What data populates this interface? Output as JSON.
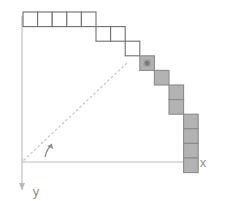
{
  "figure": {
    "title": "",
    "background": "#ffffff",
    "origin": {
      "x": 22,
      "y": 162
    },
    "cell_size": 14.6,
    "colors": {
      "axis": "#b9b9b9",
      "cell_stroke_open": "#6f6f6f",
      "cell_stroke_filled": "#8a8a8a",
      "cell_fill_open": "#ffffff",
      "cell_fill_filled": "#b3b3b3",
      "dashed_radius": "#c4c4c4",
      "angle_arc": "#8e8e8e",
      "label": "#8e8e8e",
      "marker_dot": "#7a7a7a"
    }
  },
  "axes": {
    "x": {
      "label": "x",
      "direction": "right",
      "arrow": true
    },
    "y": {
      "label": "y",
      "direction": "down",
      "arrow": true
    }
  },
  "annotations": {
    "angle_arc": {
      "name": "theta-arc",
      "visible": true
    },
    "radius_line": {
      "name": "dashed-radius",
      "style": "dotted",
      "from": "origin",
      "to": "marker"
    },
    "marker_dot": {
      "name": "current-pixel-dot",
      "visible": true,
      "cell_index": 8
    }
  },
  "chart_data": {
    "type": "scatter",
    "title": "",
    "xlabel": "x",
    "ylabel": "y",
    "grid": false,
    "legend": null,
    "cell_size": 1,
    "xlim": [
      0,
      11
    ],
    "ylim": [
      0,
      10
    ],
    "cells": [
      {
        "col": 0,
        "row": 0,
        "filled": false
      },
      {
        "col": 1,
        "row": 0,
        "filled": false
      },
      {
        "col": 2,
        "row": 0,
        "filled": false
      },
      {
        "col": 3,
        "row": 0,
        "filled": false
      },
      {
        "col": 4,
        "row": 0,
        "filled": false
      },
      {
        "col": 5,
        "row": 1,
        "filled": false
      },
      {
        "col": 6,
        "row": 1,
        "filled": false
      },
      {
        "col": 7,
        "row": 2,
        "filled": false
      },
      {
        "col": 8,
        "row": 3,
        "filled": true
      },
      {
        "col": 9,
        "row": 4,
        "filled": true
      },
      {
        "col": 10,
        "row": 5,
        "filled": true
      },
      {
        "col": 10,
        "row": 6,
        "filled": true
      },
      {
        "col": 11,
        "row": 7,
        "filled": true
      },
      {
        "col": 11,
        "row": 8,
        "filled": true
      },
      {
        "col": 11,
        "row": 9,
        "filled": true
      },
      {
        "col": 11,
        "row": 10,
        "filled": true
      }
    ],
    "marker": {
      "col": 8,
      "row": 3
    }
  }
}
